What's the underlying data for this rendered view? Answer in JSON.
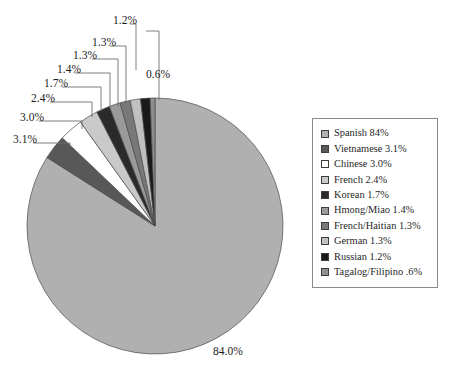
{
  "chart_data": {
    "type": "pie",
    "title": "",
    "categories": [
      "Spanish",
      "Vietnamese",
      "Chinese",
      "French",
      "Korean",
      "Hmong/Miao",
      "French/Haitian",
      "German",
      "Russian",
      "Tagalog/Filipino"
    ],
    "values": [
      84.0,
      3.1,
      3.0,
      2.4,
      1.7,
      1.4,
      1.3,
      1.3,
      1.2,
      0.6
    ],
    "slice_labels": [
      "84.0%",
      "3.1%",
      "3.0%",
      "2.4%",
      "1.7%",
      "1.4%",
      "1.3%",
      "1.3%",
      "1.2%",
      "0.6%"
    ],
    "colors": [
      "#b0b0b0",
      "#585858",
      "#ffffff",
      "#c9c9c9",
      "#2a2a2a",
      "#9a9a9a",
      "#787878",
      "#c0c0c0",
      "#1a1a1a",
      "#8e8e8e"
    ],
    "legend_position": "right",
    "grid": false,
    "start_angle_deg": -90,
    "direction": "clockwise"
  },
  "legend": {
    "items": [
      {
        "label": "Spanish 84%",
        "swatch": "#b0b0b0"
      },
      {
        "label": "Vietnamese 3.1%",
        "swatch": "#585858"
      },
      {
        "label": "Chinese 3.0%",
        "swatch": "#ffffff"
      },
      {
        "label": "French 2.4%",
        "swatch": "#c9c9c9"
      },
      {
        "label": "Korean 1.7%",
        "swatch": "#2a2a2a"
      },
      {
        "label": "Hmong/Miao 1.4%",
        "swatch": "#9a9a9a"
      },
      {
        "label": "French/Haitian 1.3%",
        "swatch": "#787878"
      },
      {
        "label": "German 1.3%",
        "swatch": "#c0c0c0"
      },
      {
        "label": "Russian 1.2%",
        "swatch": "#1a1a1a"
      },
      {
        "label": "Tagalog/Filipino .6%",
        "swatch": "#8e8e8e"
      }
    ]
  },
  "callouts": [
    {
      "text": "1.2%",
      "x": 113,
      "y": 24
    },
    {
      "text": "1.3%",
      "x": 92,
      "y": 46
    },
    {
      "text": "1.3%",
      "x": 73,
      "y": 59
    },
    {
      "text": "1.4%",
      "x": 57,
      "y": 73
    },
    {
      "text": "1.7%",
      "x": 44,
      "y": 87
    },
    {
      "text": "2.4%",
      "x": 31,
      "y": 102
    },
    {
      "text": "3.0%",
      "x": 20,
      "y": 121
    },
    {
      "text": "3.1%",
      "x": 13,
      "y": 143
    },
    {
      "text": "0.6%",
      "x": 146,
      "y": 78
    },
    {
      "text": "84.0%",
      "x": 213,
      "y": 355
    }
  ]
}
